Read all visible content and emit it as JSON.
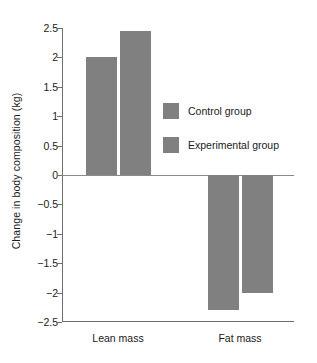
{
  "chart_data": {
    "type": "bar",
    "title": "",
    "xlabel": "",
    "ylabel": "Change in body composition (kg)",
    "categories": [
      "Lean mass",
      "Fat mass"
    ],
    "series": [
      {
        "name": "Control group",
        "values": [
          2.0,
          -2.3
        ]
      },
      {
        "name": "Experimental group",
        "values": [
          2.45,
          -2.0
        ]
      }
    ],
    "ylim": [
      -2.5,
      2.5
    ],
    "ytick_labels": [
      "2.5",
      "2",
      "1.5",
      "1",
      "0.5",
      "0",
      "−0.5",
      "−1",
      "−1.5",
      "−2",
      "−2.5"
    ],
    "ytick_values": [
      2.5,
      2,
      1.5,
      1,
      0.5,
      0,
      -0.5,
      -1,
      -1.5,
      -2,
      -2.5
    ],
    "grid": false,
    "legend_position": "center-right",
    "bar_color": "#808080",
    "axis_color": "#6e6e6e",
    "zero_line": 0
  },
  "legend": {
    "entries": [
      {
        "label": "Control group",
        "color": "#808080"
      },
      {
        "label": "Experimental group",
        "color": "#808080"
      }
    ]
  }
}
